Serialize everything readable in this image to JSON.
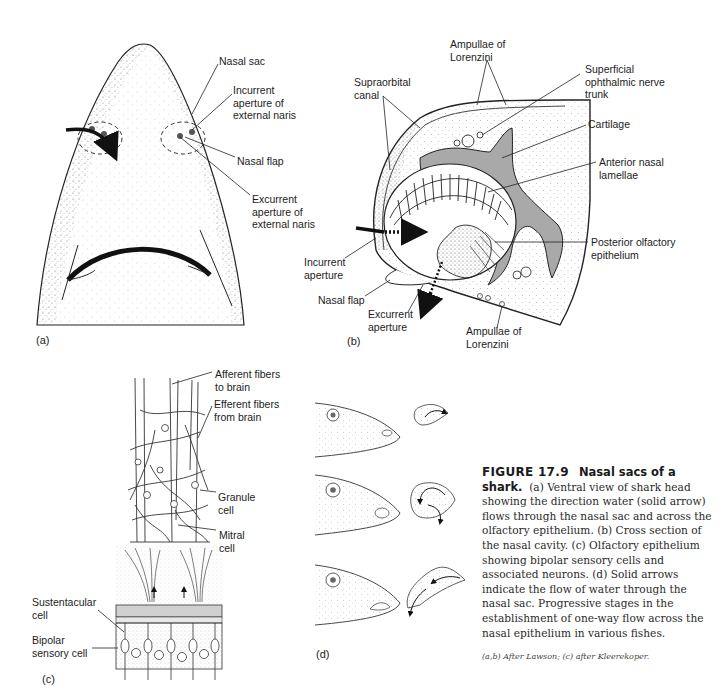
{
  "figure": {
    "number": "FIGURE 17.9",
    "title": "Nasal sacs of a shark.",
    "caption_body": "(a) Ventral view of shark head showing the direction water (solid arrow) flows through the nasal sac and across the olfactory epithelium. (b) Cross section of the nasal cavity. (c) Olfactory epithelium showing bipolar sensory cells and associated neurons. (d) Solid arrows indicate the flow of water through the nasal sac. Progressive stages in the establishment of one-way flow across the nasal epithelium in various fishes.",
    "credit": "(a,b) After Lawson; (c) after Kleerekoper."
  },
  "panels": {
    "a": {
      "tag": "(a)",
      "labels": {
        "nasal_sac": "Nasal sac",
        "incurrent": "Incurrent\naperture of\nexternal naris",
        "nasal_flap": "Nasal flap",
        "excurrent": "Excurrent\naperture of\nexternal naris"
      }
    },
    "b": {
      "tag": "(b)",
      "labels": {
        "ampullae_top": "Ampullae of\nLorenzini",
        "supraorbital": "Supraorbital\ncanal",
        "superficial": "Superficial\nophthalmic nerve\ntrunk",
        "cartilage": "Cartilage",
        "anterior": "Anterior nasal\nlamellae",
        "posterior": "Posterior olfactory\nepithelium",
        "incurrent": "Incurrent\naperture",
        "nasal_flap": "Nasal flap",
        "excurrent": "Excurrent\naperture",
        "ampullae_bottom": "Ampullae of\nLorenzini"
      }
    },
    "c": {
      "tag": "(c)",
      "labels": {
        "afferent": "Afferent fibers\nto brain",
        "efferent": "Efferent fibers\nfrom brain",
        "granule": "Granule\ncell",
        "mitral": "Mitral\ncell",
        "sustentacular": "Sustentacular\ncell",
        "bipolar": "Bipolar\nsensory cell"
      }
    },
    "d": {
      "tag": "(d)"
    }
  },
  "colors": {
    "ink": "#1a1a1a",
    "cartilage": "#a9a9a9",
    "stipple": "#7a7a7a",
    "paper": "#ffffff"
  }
}
